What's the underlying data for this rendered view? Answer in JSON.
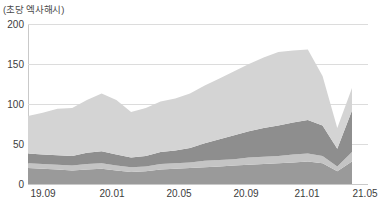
{
  "chart_data": {
    "type": "area",
    "stacked": true,
    "title": "",
    "unit_label": "(초당 엑사해시)",
    "xlabel": "",
    "ylabel": "",
    "ylim": [
      0,
      200
    ],
    "yticks": [
      0,
      50,
      100,
      150,
      200
    ],
    "grid": true,
    "legend": "none",
    "xticks": [
      "19.09",
      "20.01",
      "20.05",
      "20.09",
      "21.01",
      "21.05"
    ],
    "xtick_positions": [
      1,
      5,
      9,
      13,
      17,
      21
    ],
    "x": [
      "19.09",
      "19.10",
      "19.11",
      "19.12",
      "20.01",
      "20.02",
      "20.03",
      "20.04",
      "20.05",
      "20.06",
      "20.07",
      "20.08",
      "20.09",
      "20.10",
      "20.11",
      "20.12",
      "21.01",
      "21.02",
      "21.03",
      "21.04",
      "21.05",
      "21.06",
      "21.07"
    ],
    "colors": {
      "band_1_bottom": "#9a9a9a",
      "band_2": "#c4c4c4",
      "band_3": "#8e8e8e",
      "band_4_top": "#d4d4d4",
      "gridline": "#dcdcdc",
      "axis": "#c9c9c9",
      "text": "#3c3c3c"
    },
    "series": [
      {
        "name": "band_1_bottom",
        "color": "#9a9a9a",
        "values": [
          20,
          19,
          18,
          17,
          18,
          19,
          17,
          15,
          16,
          18,
          19,
          20,
          21,
          22,
          23,
          24,
          25,
          26,
          27,
          28,
          26,
          16,
          28
        ]
      },
      {
        "name": "band_2",
        "color": "#c4c4c4",
        "values": [
          6,
          6,
          6,
          6,
          7,
          7,
          6,
          6,
          6,
          7,
          7,
          7,
          8,
          8,
          8,
          9,
          9,
          9,
          10,
          10,
          9,
          6,
          12
        ]
      },
      {
        "name": "band_3",
        "color": "#8e8e8e",
        "values": [
          12,
          12,
          12,
          12,
          14,
          15,
          14,
          12,
          13,
          15,
          16,
          18,
          22,
          26,
          30,
          33,
          36,
          38,
          40,
          42,
          38,
          22,
          52
        ]
      },
      {
        "name": "band_4_top",
        "color": "#d4d4d4",
        "values": [
          47,
          52,
          58,
          60,
          66,
          72,
          68,
          57,
          60,
          63,
          65,
          68,
          72,
          76,
          80,
          84,
          88,
          92,
          90,
          88,
          62,
          26,
          28
        ]
      }
    ],
    "totals": [
      85,
      89,
      94,
      95,
      105,
      113,
      105,
      90,
      95,
      103,
      107,
      113,
      123,
      132,
      141,
      150,
      158,
      165,
      167,
      168,
      135,
      70,
      120
    ],
    "notes": {
      "peak_total": 168,
      "peak_x": "21.04",
      "trough_after_drop": 70,
      "trough_x": "21.06",
      "final_total": 120,
      "final_x": "21.07"
    }
  }
}
